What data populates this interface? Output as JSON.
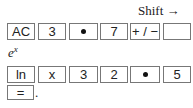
{
  "shift_label": "Shift →",
  "row1": {
    "keys": [
      {
        "label": "AC",
        "type": "text"
      },
      {
        "label": "3",
        "type": "text"
      },
      {
        "label": "•",
        "type": "dot"
      },
      {
        "label": "7",
        "type": "text"
      },
      {
        "label": "+ / −",
        "type": "text"
      },
      {
        "label": "",
        "type": "blank"
      }
    ]
  },
  "ex_label": {
    "base": "e",
    "exponent": "x"
  },
  "row2": {
    "keys": [
      {
        "label": "ln",
        "type": "text"
      },
      {
        "label": "x",
        "type": "text"
      },
      {
        "label": "3",
        "type": "text"
      },
      {
        "label": "2",
        "type": "text"
      },
      {
        "label": "•",
        "type": "dot"
      },
      {
        "label": "5",
        "type": "text"
      }
    ]
  },
  "row3": {
    "keys": [
      {
        "label": "=",
        "type": "text"
      }
    ],
    "trailing": "."
  }
}
